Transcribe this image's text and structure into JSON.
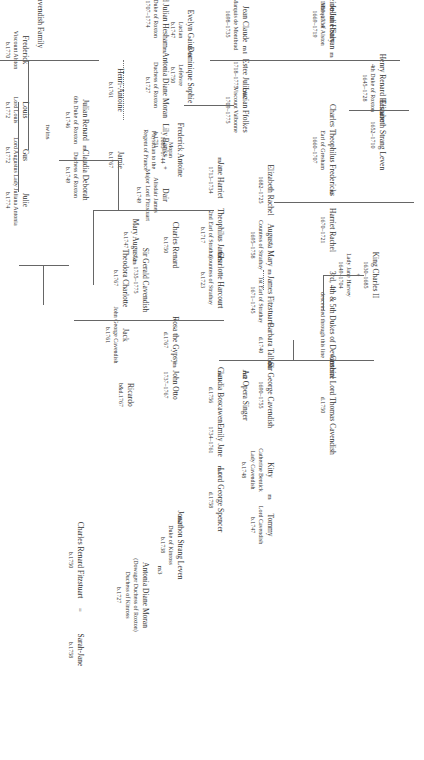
{
  "title": "The Cavendish Family",
  "people": [
    {
      "id": "title",
      "lines": [
        "The Cavendish Family"
      ],
      "x": 380,
      "y": 14,
      "cls": "title"
    },
    {
      "id": "henry-renard",
      "lines": [
        "Henry Renard Hesham",
        "4th Duke of Roxton",
        "1645–1728"
      ],
      "x": 38,
      "y": 88
    },
    {
      "id": "elizabeth-strang",
      "lines": [
        "Elizabeth Strang Leven",
        "1652–1710"
      ],
      "x": 38,
      "y": 135
    },
    {
      "id": "king-charles",
      "lines": [
        "King Charles II",
        "1630–1685",
        "+",
        "Lady Jane Harvey",
        "1649–1704"
      ],
      "x": 45,
      "y": 275
    },
    {
      "id": "dukes-devonshire",
      "lines": [
        "3rd, 4th & 5th Dukes of Devonshire",
        "descended through this line"
      ],
      "x": 88,
      "y": 325
    },
    {
      "id": "gen-thomas",
      "lines": [
        "General Lord Thomas Cavendish",
        "d.1750"
      ],
      "x": 88,
      "y": 405
    },
    {
      "id": "kitty",
      "lines": [
        "Kitty",
        "Catherine Bentick",
        "Lady Cavendish",
        "b.1748"
      ],
      "x": 150,
      "y": 470
    },
    {
      "id": "tommy",
      "lines": [
        "Tommy",
        "Lord Cavendish",
        "b.1747"
      ],
      "x": 150,
      "y": 525
    },
    {
      "id": "emily-jane",
      "lines": [
        "Emily Jane",
        "1734–1761"
      ],
      "x": 200,
      "y": 440
    },
    {
      "id": "lord-george-spencer",
      "lines": [
        "Lord George Spencer",
        "d.1758"
      ],
      "x": 200,
      "y": 500
    },
    {
      "id": "jonathon-strang",
      "lines": [
        "Jonathon Strang Leven",
        "Duke of Kinross",
        "b.1738"
      ],
      "x": 240,
      "y": 545
    },
    {
      "id": "antonia-dowager",
      "lines": [
        "Antonia Diane Moran",
        "(Dowager Duchess of Roxton)",
        "Duchess of Kinross",
        "b.1727"
      ],
      "x": 275,
      "y": 595
    },
    {
      "id": "sarah-jane",
      "lines": [
        "Sarah-Jane",
        "b.1758"
      ],
      "x": 340,
      "y": 650
    },
    {
      "id": "charles-renard-fitz",
      "lines": [
        "Charles Renard Fitzstuart",
        "b.1750"
      ],
      "x": 340,
      "y": 560
    },
    {
      "id": "julian-henry",
      "lines": [
        "Julian Henry",
        "Marquis of Alston",
        "1669–1719"
      ],
      "x": 88,
      "y": 24
    },
    {
      "id": "madeleine",
      "lines": [
        "Madeleine-Julie Salvan",
        "1689–1734"
      ],
      "x": 88,
      "y": 14
    },
    {
      "id": "charles-theophilus",
      "lines": [
        "Charles Theophilus Fredericks",
        "Earl of Gresham",
        "1660–1707"
      ],
      "x": 88,
      "y": 150
    },
    {
      "id": "harriet-rachel",
      "lines": [
        "Harriet Rachel",
        "1670–1721"
      ],
      "x": 88,
      "y": 230
    },
    {
      "id": "elizabeth-rachel",
      "lines": [
        "Elizabeth Rachel",
        "1682–1725"
      ],
      "x": 150,
      "y": 190
    },
    {
      "id": "augusta-mary",
      "lines": [
        "Augusta Mary",
        "Countess of Strathay",
        "1695–1758"
      ],
      "x": 150,
      "y": 245
    },
    {
      "id": "james-fitzstuart",
      "lines": [
        "James Fitzstuart",
        "1st Earl of Strathay",
        "1671–1745"
      ],
      "x": 150,
      "y": 300
    },
    {
      "id": "barbara-talbot",
      "lines": [
        "Barbara Talbot",
        "d.1740"
      ],
      "x": 150,
      "y": 345
    },
    {
      "id": "sir-george",
      "lines": [
        "Sir George Cavendish",
        "1690–1755"
      ],
      "x": 150,
      "y": 395
    },
    {
      "id": "opera-singer",
      "lines": [
        "An Opera Singer"
      ],
      "x": 175,
      "y": 395
    },
    {
      "id": "claudia-boscawen",
      "lines": [
        "Claudia Boscawen",
        "d.1756"
      ],
      "x": 200,
      "y": 395
    },
    {
      "id": "jean-claude",
      "lines": [
        "Jean Claude",
        "Marquis de Montbrad",
        "1698–1735"
      ],
      "x": 175,
      "y": 24
    },
    {
      "id": "estee-julie",
      "lines": [
        "Estee Julie",
        "1718–1775"
      ],
      "x": 175,
      "y": 75
    },
    {
      "id": "lucian-ffolkes",
      "lines": [
        "Lucian Ffolkes",
        "Viscount Valbonne",
        "1709–1775"
      ],
      "x": 175,
      "y": 110
    },
    {
      "id": "jane-harriet",
      "lines": [
        "Jane Harriet",
        "1713–1734"
      ],
      "x": 200,
      "y": 180
    },
    {
      "id": "theophilus-james",
      "lines": [
        "Theophilus James",
        "2nd Earl of Strathay",
        "b.1717"
      ],
      "x": 200,
      "y": 235
    },
    {
      "id": "charlotte-harcourt",
      "lines": [
        "Charlotte Harcourt",
        "Countess of Strathay",
        "b.1723"
      ],
      "x": 200,
      "y": 280
    },
    {
      "id": "rosa-gypsy",
      "lines": [
        "Rosa the Gypsy",
        "d.1767"
      ],
      "x": 245,
      "y": 340
    },
    {
      "id": "john-otto",
      "lines": [
        "John Otto",
        "1737–1767"
      ],
      "x": 245,
      "y": 385
    },
    {
      "id": "evelyn-gaius",
      "lines": [
        "Evelyn Gaius",
        "Lucian",
        "b.1747"
      ],
      "x": 230,
      "y": 30
    },
    {
      "id": "dominique",
      "lines": [
        "Dominique Sophie",
        "Lefebvre",
        "b.1750"
      ],
      "x": 230,
      "y": 75
    },
    {
      "id": "frederick-antoine",
      "lines": [
        "Frederick Antoine",
        "Moran",
        "1685–1744",
        "Physician to the",
        "Regent of France"
      ],
      "x": 240,
      "y": 150
    },
    {
      "id": "charles-renard",
      "lines": [
        "Charles Renard",
        "b.1750"
      ],
      "x": 245,
      "y": 245
    },
    {
      "id": "sir-gerald",
      "lines": [
        "Sir Gerald Cavendish",
        "1735–1775"
      ],
      "x": 275,
      "y": 280
    },
    {
      "id": "jack",
      "lines": [
        "Jack",
        "John George Cavendish",
        "b.1761"
      ],
      "x": 295,
      "y": 335
    },
    {
      "id": "ricardo",
      "lines": [
        "Ricardo",
        "b&d.1767"
      ],
      "x": 290,
      "y": 395
    },
    {
      "id": "mary-augusta",
      "lines": [
        "Mary Augusta",
        "b.1747"
      ],
      "x": 285,
      "y": 240
    },
    {
      "id": "theodora",
      "lines": [
        "Theodora Charlotte",
        "b.1767"
      ],
      "x": 295,
      "y": 278
    },
    {
      "id": "dair",
      "lines": [
        "Dair",
        "Alisdair James",
        "Major Lord Fitzstuart",
        "b.1749"
      ],
      "x": 255,
      "y": 195
    },
    {
      "id": "lily-banks",
      "lines": [
        "Lily Banks",
        "b.1751"
      ],
      "x": 255,
      "y": 140
    },
    {
      "id": "jamie",
      "lines": [
        "Jamie",
        "b.1767"
      ],
      "x": 300,
      "y": 160
    },
    {
      "id": "renard-julian",
      "lines": [
        "Renard Julian Hesham",
        "5th Duke of Roxton",
        "1707–1774"
      ],
      "x": 255,
      "y": 14
    },
    {
      "id": "antonia-moran",
      "lines": [
        "Antonia Diane Moran",
        "Duchess of Roxton",
        "b.1727"
      ],
      "x": 255,
      "y": 85
    },
    {
      "id": "henri-antoine",
      "lines": [
        "Henri-Antoine",
        "b.1761"
      ],
      "x": 300,
      "y": 90
    },
    {
      "id": "julian-renard",
      "lines": [
        "Julian Renard",
        "6th Duke of Roxton",
        "b.1746"
      ],
      "x": 335,
      "y": 120
    },
    {
      "id": "claudia-deborah",
      "lines": [
        "Claudia Deborah",
        "Duchess of Roxton",
        "b.1749"
      ],
      "x": 335,
      "y": 175
    },
    {
      "id": "frederick",
      "lines": [
        "Frederick",
        "Viscount Alston",
        "b.1770"
      ],
      "x": 395,
      "y": 50
    },
    {
      "id": "louis",
      "lines": [
        "Louis",
        "Lord Louis",
        "b.1772"
      ],
      "x": 395,
      "y": 110
    },
    {
      "id": "gus",
      "lines": [
        "Gus",
        "Lord Augustus",
        "b.1772"
      ],
      "x": 395,
      "y": 155
    },
    {
      "id": "julie",
      "lines": [
        "Julie",
        "Lady Juliana Antonia",
        "b.1774"
      ],
      "x": 395,
      "y": 200
    }
  ],
  "marks": [
    {
      "t": "m",
      "x": 38,
      "y": 112
    },
    {
      "t": "m",
      "x": 88,
      "y": 192
    },
    {
      "t": "m",
      "x": 150,
      "y": 272
    },
    {
      "t": "m",
      "x": 200,
      "y": 255
    },
    {
      "t": "m1",
      "x": 150,
      "y": 365
    },
    {
      "t": "m2",
      "x": 175,
      "y": 375
    },
    {
      "t": "m3",
      "x": 200,
      "y": 375
    },
    {
      "t": "m",
      "x": 88,
      "y": 55
    },
    {
      "t": "m1",
      "x": 175,
      "y": 50
    },
    {
      "t": "m2",
      "x": 175,
      "y": 95
    },
    {
      "t": "m",
      "x": 230,
      "y": 55
    },
    {
      "t": "m",
      "x": 200,
      "y": 160
    },
    {
      "t": "m",
      "x": 245,
      "y": 365
    },
    {
      "t": "m",
      "x": 285,
      "y": 262
    },
    {
      "t": "+",
      "x": 255,
      "y": 168
    },
    {
      "t": "m",
      "x": 255,
      "y": 50
    },
    {
      "t": "m",
      "x": 335,
      "y": 148
    },
    {
      "t": "m",
      "x": 150,
      "y": 497
    },
    {
      "t": "m1",
      "x": 200,
      "y": 470
    },
    {
      "t": "m2",
      "x": 240,
      "y": 520
    },
    {
      "t": "m3",
      "x": 260,
      "y": 570
    },
    {
      "t": "=",
      "x": 340,
      "y": 610
    },
    {
      "t": "twins",
      "x": 372,
      "y": 132
    }
  ]
}
